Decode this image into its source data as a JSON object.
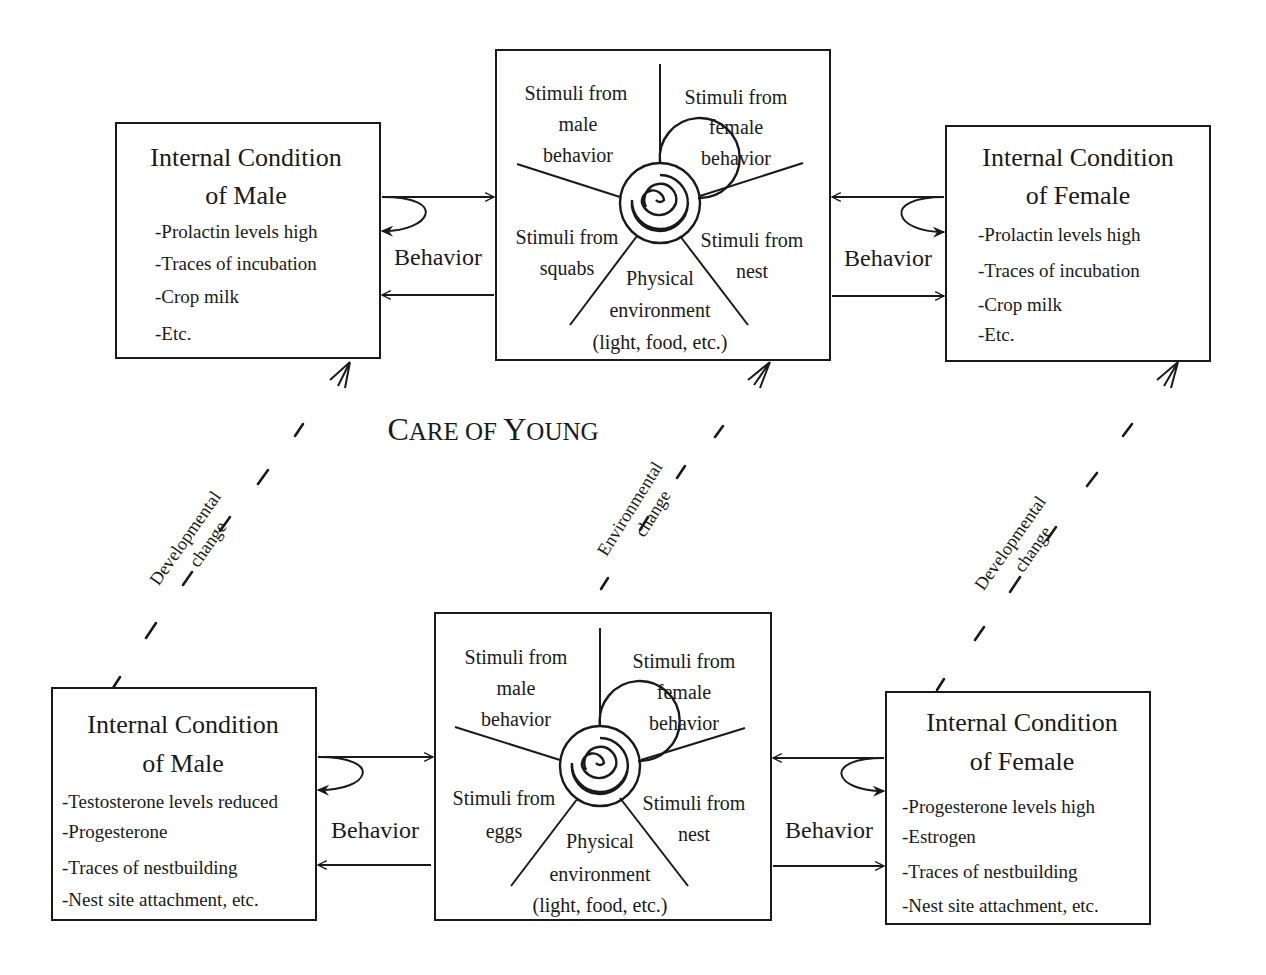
{
  "diagram": {
    "section_label": {
      "parts": [
        {
          "text": "C",
          "big": true
        },
        {
          "text": "ARE OF ",
          "big": false
        },
        {
          "text": "Y",
          "big": true
        },
        {
          "text": "OUNG",
          "big": false
        }
      ],
      "full": "Care of Young"
    },
    "top": {
      "male": {
        "title_line1": "Internal Condition",
        "title_line2": "of Male",
        "items": [
          "-Prolactin levels high",
          "-Traces of incubation",
          "-Crop milk",
          "-Etc."
        ]
      },
      "female": {
        "title_line1": "Internal Condition",
        "title_line2": "of Female",
        "items": [
          "-Prolactin levels high",
          "-Traces of incubation",
          "-Crop milk",
          "-Etc."
        ]
      },
      "stimuli": {
        "male_behavior": [
          "Stimuli  from",
          "male",
          "behavior"
        ],
        "female_behavior": [
          "Stimuli  from",
          "female",
          "behavior"
        ],
        "young": [
          "Stimuli from",
          "squabs"
        ],
        "nest": [
          "Stimuli from",
          "nest"
        ],
        "physical": [
          "Physical",
          "environment",
          "(light, food, etc.)"
        ]
      },
      "behavior_left": "Behavior",
      "behavior_right": "Behavior"
    },
    "bottom": {
      "male": {
        "title_line1": "Internal Condition",
        "title_line2": "of Male",
        "items": [
          "-Testosterone levels reduced",
          "-Progesterone",
          "-Traces of nestbuilding",
          "-Nest site attachment, etc."
        ]
      },
      "female": {
        "title_line1": "Internal Condition",
        "title_line2": "of Female",
        "items": [
          "-Progesterone levels high",
          "-Estrogen",
          "-Traces of nestbuilding",
          "-Nest site attachment, etc."
        ]
      },
      "stimuli": {
        "male_behavior": [
          "Stimuli  from",
          "male",
          "behavior"
        ],
        "female_behavior": [
          "Stimuli  from",
          "female",
          "behavior"
        ],
        "young": [
          "Stimuli from",
          "eggs"
        ],
        "nest": [
          "Stimuli from",
          "nest"
        ],
        "physical": [
          "Physical",
          "environment",
          "(light, food, etc.)"
        ]
      },
      "behavior_left": "Behavior",
      "behavior_right": "Behavior"
    },
    "transitions": {
      "left": [
        "Developmental",
        "change"
      ],
      "middle": [
        "Environmental",
        "change"
      ],
      "right": [
        "Developmental",
        "change"
      ]
    }
  }
}
